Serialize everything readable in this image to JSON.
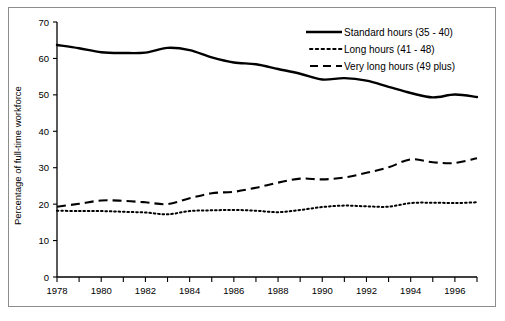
{
  "chart_data": {
    "type": "line",
    "title": "",
    "subtitle": "",
    "xlabel": "",
    "ylabel": "Percentage of full-time workforce",
    "xlim": [
      1978,
      1997
    ],
    "ylim": [
      0,
      70
    ],
    "grid": false,
    "legend_position": "top-right",
    "x": [
      1978,
      1979,
      1980,
      1981,
      1982,
      1983,
      1984,
      1985,
      1986,
      1987,
      1988,
      1989,
      1990,
      1991,
      1992,
      1993,
      1994,
      1995,
      1996,
      1997
    ],
    "x_tick_labels": [
      "1978",
      "",
      "1980",
      "",
      "1982",
      "",
      "1984",
      "",
      "1986",
      "",
      "1988",
      "",
      "1990",
      "",
      "1992",
      "",
      "1994",
      "",
      "1996",
      ""
    ],
    "y_ticks": [
      0,
      10,
      20,
      30,
      40,
      50,
      60,
      70
    ],
    "y_tick_labels": [
      "0",
      "10",
      "20",
      "30",
      "40",
      "50",
      "60",
      "70"
    ],
    "series": [
      {
        "name": "Standard hours (35 - 40)",
        "style": "solid",
        "color": "#000000",
        "values": [
          63.7,
          62.8,
          61.7,
          61.5,
          61.6,
          62.9,
          62.3,
          60.3,
          58.9,
          58.4,
          57.1,
          55.8,
          54.2,
          54.6,
          53.9,
          52.2,
          50.5,
          49.3,
          50.1,
          49.4
        ]
      },
      {
        "name": "Long hours (41 - 48)",
        "style": "dotted",
        "color": "#000000",
        "values": [
          18.2,
          18.1,
          18.1,
          17.9,
          17.7,
          17.2,
          18.1,
          18.3,
          18.4,
          18.2,
          17.8,
          18.4,
          19.2,
          19.6,
          19.4,
          19.3,
          20.3,
          20.4,
          20.3,
          20.5
        ]
      },
      {
        "name": "Very long hours (49 plus)",
        "style": "dashed",
        "color": "#000000",
        "values": [
          19.3,
          20.1,
          21.0,
          20.9,
          20.5,
          20.0,
          21.6,
          23.0,
          23.4,
          24.5,
          25.9,
          27.0,
          26.8,
          27.3,
          28.6,
          30.1,
          32.3,
          31.5,
          31.3,
          32.6
        ]
      }
    ]
  },
  "legend": {
    "items": [
      {
        "label": "Standard hours (35 - 40)",
        "style": "solid"
      },
      {
        "label": "Long hours (41 - 48)",
        "style": "dotted"
      },
      {
        "label": "Very long hours (49 plus)",
        "style": "dashed"
      }
    ]
  },
  "axes": {
    "y_title": "Percentage of full-time workforce"
  }
}
